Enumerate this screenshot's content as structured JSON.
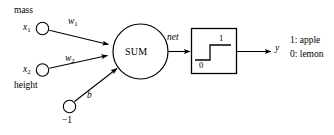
{
  "diagram": {
    "stroke_color": "#000000",
    "background_color": "#ffffff",
    "inputs": [
      {
        "id": "x1",
        "variable": "x",
        "subscript": "1",
        "feature_label": "mass",
        "weight_label": "w",
        "weight_subscript": "1"
      },
      {
        "id": "x2",
        "variable": "x",
        "subscript": "2",
        "feature_label": "height",
        "weight_label": "w",
        "weight_subscript": "2"
      }
    ],
    "bias": {
      "id": "bias",
      "node_label": "−1",
      "weight_label": "b"
    },
    "summation": {
      "label": "SUM"
    },
    "net_label": "net",
    "activation": {
      "type": "step",
      "low_label": "0",
      "high_label": "1"
    },
    "output": {
      "label": "y"
    },
    "legend": [
      {
        "value": "1",
        "separator": ":",
        "class_name": "apple"
      },
      {
        "value": "0",
        "separator": ":",
        "class_name": "lemon"
      }
    ]
  }
}
